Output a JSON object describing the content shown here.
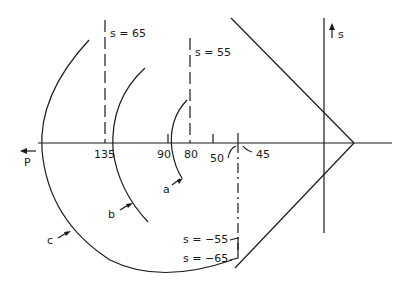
{
  "diagram": {
    "axes": {
      "horizontal_label": "P",
      "vertical_label": "s"
    },
    "tick_labels": [
      "135",
      "90",
      "80",
      "50",
      "45"
    ],
    "boundary_labels": {
      "s_65": "s = 65",
      "s_55": "s = 55",
      "s_neg55": "s = −55",
      "s_neg65": "s = −65"
    },
    "curve_labels": [
      "a",
      "b",
      "c"
    ]
  }
}
